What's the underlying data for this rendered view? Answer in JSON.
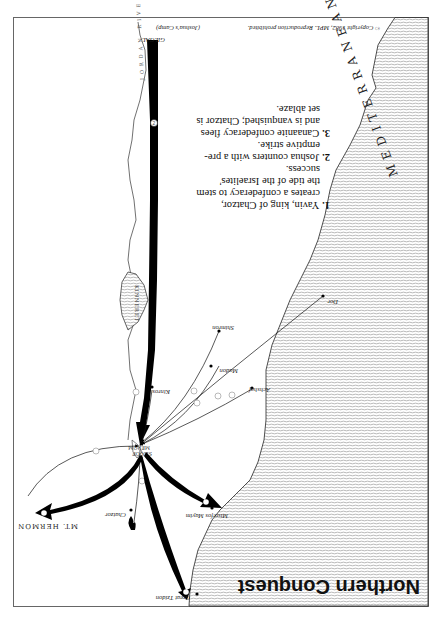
{
  "map": {
    "title": "Northern Conquest",
    "orientation": "rotated 180 degrees",
    "copyright": "© Copyright 1982, MPL. Reproduction prohibited.",
    "sea_label": "MEDITERRANEAN SEA",
    "river_label": "JORDAN RIVER",
    "lake_labels": {
      "kinneret": "KINNERET",
      "merom": "SEA OF MEROM"
    },
    "mountain_label": "MT. HERMON",
    "gilgal": {
      "label": "GILGAL",
      "sublabel": "(Joshua's Camp)"
    },
    "places": [
      {
        "id": "great-tzidon",
        "label": "Great Tzidon"
      },
      {
        "id": "misrefos-mayim",
        "label": "Misrefos Mayim"
      },
      {
        "id": "chatzor",
        "label": "Chatzor"
      },
      {
        "id": "achshaf",
        "label": "Achshaf"
      },
      {
        "id": "madon",
        "label": "Madon"
      },
      {
        "id": "shimron",
        "label": "Shimron"
      },
      {
        "id": "dor",
        "label": "Dor"
      },
      {
        "id": "kinros",
        "label": "Kinros"
      }
    ],
    "legend": [
      {
        "num": "1.",
        "text": "Yavin, king of Chatzor, creates a confederacy to stem the tide of the Israelites' success."
      },
      {
        "num": "2.",
        "text": "Joshua counters with a pre-emptive strike."
      },
      {
        "num": "3.",
        "text": "Canaanite confederacy flees and is vanquished; Chatzor is set ablaze."
      }
    ],
    "legend_lines": [
      [
        "1.",
        "Yavin,  king  of  Chatzor,"
      ],
      [
        "",
        "creates a confederacy to stem"
      ],
      [
        "",
        "the  tide  of  the  Israelites'"
      ],
      [
        "",
        "success."
      ],
      [
        "2.",
        "Joshua counters with a pre-"
      ],
      [
        "",
        "emptive strike."
      ],
      [
        "3.",
        "Canaanite confederacy flees"
      ],
      [
        "",
        "and is vanquished; Chatzor is"
      ],
      [
        "",
        "set ablaze."
      ]
    ],
    "route_markers": {
      "confederacy": "1",
      "joshua": "2",
      "flight": "3"
    },
    "colors": {
      "sea_hatch": "#8a8a8a",
      "arrow": "#000000",
      "frame": "#555555",
      "background": "#ffffff"
    }
  }
}
